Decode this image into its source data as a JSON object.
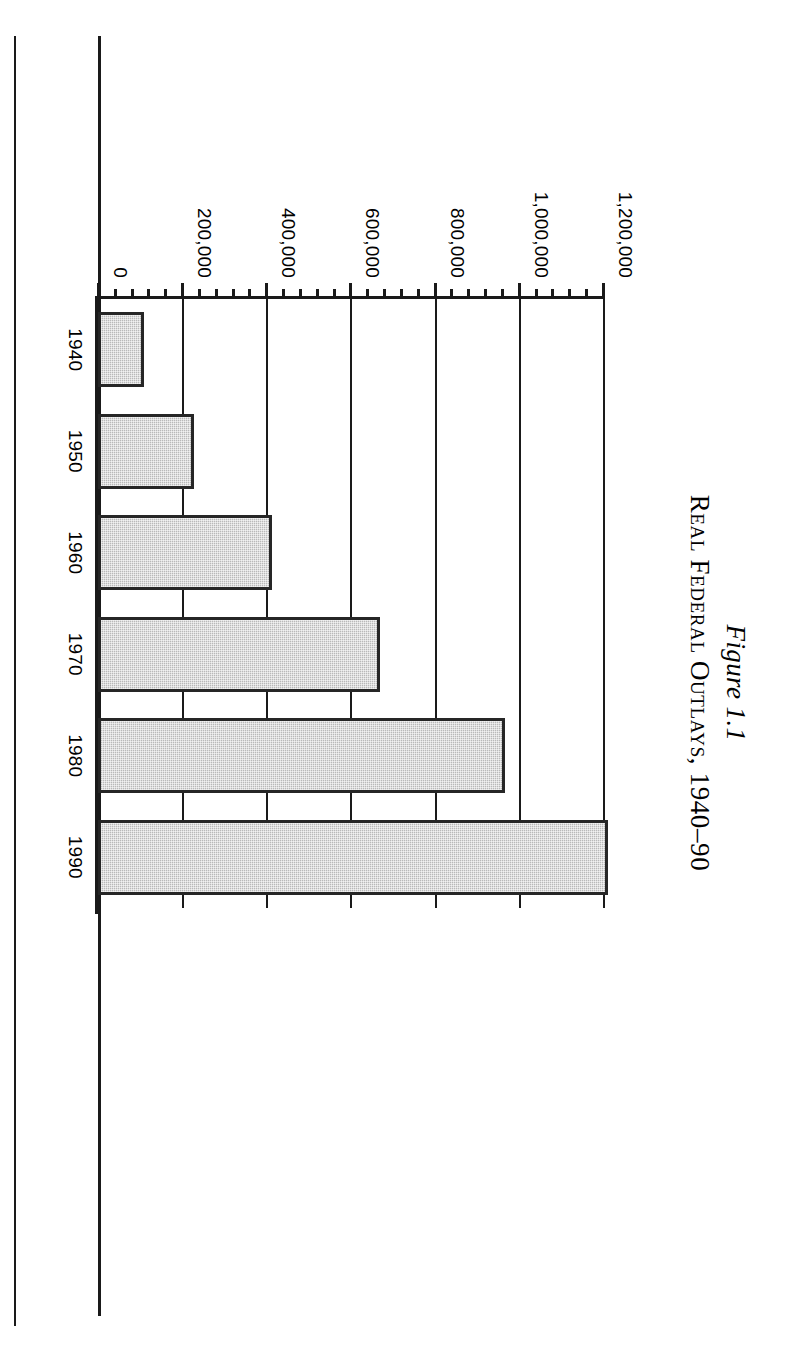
{
  "figure": {
    "number": "Figure 1.1",
    "title": "Real Federal Outlays, 1940–90"
  },
  "chart_data": {
    "type": "bar",
    "orientation": "horizontal",
    "title": "Real Federal Outlays, 1940–90",
    "subtitle": "Figure 1.1",
    "categories": [
      "1940",
      "1950",
      "1960",
      "1970",
      "1980",
      "1990"
    ],
    "values": [
      110000,
      228000,
      414000,
      671000,
      966000,
      1212000
    ],
    "xlabel": "",
    "ylabel": "Million 1990 Dollars",
    "ylim": [
      0,
      1200000
    ],
    "ytick_labels": [
      "1,200,000",
      "1,000,000",
      "800,000",
      "600,000",
      "400,000",
      "200,000",
      "0"
    ],
    "ytick_values": [
      1200000,
      1000000,
      800000,
      600000,
      400000,
      200000,
      0
    ],
    "ytick_minor_step": 40000,
    "grid": true,
    "legend": "none",
    "bar_fill": "#b9b9b9",
    "bar_edge": "#262626"
  },
  "axis": {
    "value_axis_title": "Million 1990 Dollars",
    "ticks": [
      {
        "label": "1,200,000",
        "value": 1200000
      },
      {
        "label": "1,000,000",
        "value": 1000000
      },
      {
        "label": "800,000",
        "value": 800000
      },
      {
        "label": "600,000",
        "value": 600000
      },
      {
        "label": "400,000",
        "value": 400000
      },
      {
        "label": "200,000",
        "value": 200000
      },
      {
        "label": "0",
        "value": 0
      }
    ]
  },
  "bars": [
    {
      "category": "1940",
      "value": 110000
    },
    {
      "category": "1950",
      "value": 228000
    },
    {
      "category": "1960",
      "value": 414000
    },
    {
      "category": "1970",
      "value": 671000
    },
    {
      "category": "1980",
      "value": 966000
    },
    {
      "category": "1990",
      "value": 1212000
    }
  ]
}
